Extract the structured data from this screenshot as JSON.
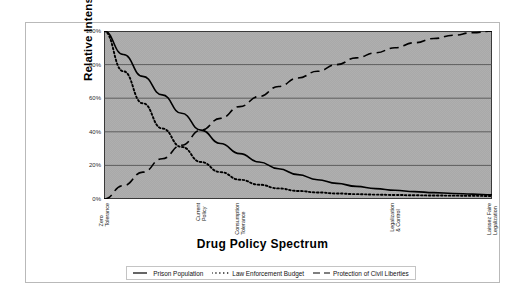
{
  "chart_data": {
    "type": "line",
    "title": "",
    "xlabel": "Drug Policy Spectrum",
    "ylabel": "Relative Intensity",
    "ylim": [
      0,
      100
    ],
    "ytick_labels": [
      "0%",
      "20%",
      "40%",
      "60%",
      "80%",
      "100%"
    ],
    "ytick_values": [
      0,
      20,
      40,
      60,
      80,
      100
    ],
    "grid": "horizontal",
    "legend_position": "bottom",
    "x_axis_ticks": 20,
    "categories": [
      {
        "label_line1": "Zero",
        "label_line2": "Tolerance",
        "x": 0.0
      },
      {
        "label_line1": "Current",
        "label_line2": "Policy",
        "x": 0.25
      },
      {
        "label_line1": "Consumption",
        "label_line2": "Tolerance",
        "x": 0.35
      },
      {
        "label_line1": "Legalization",
        "label_line2": "& Control",
        "x": 0.75
      },
      {
        "label_line1": "Laissez Faire",
        "label_line2": "Legalization",
        "x": 1.0
      }
    ],
    "series": [
      {
        "name": "Prison Population",
        "style": "solid",
        "color": "#000000",
        "x": [
          0,
          0.05,
          0.1,
          0.15,
          0.2,
          0.25,
          0.3,
          0.35,
          0.4,
          0.45,
          0.5,
          0.55,
          0.6,
          0.65,
          0.7,
          0.75,
          0.8,
          0.85,
          0.9,
          0.95,
          1.0
        ],
        "values": [
          100,
          86,
          73,
          62,
          51,
          41,
          33,
          27,
          22,
          18,
          14.5,
          11.5,
          9.3,
          7.5,
          6.2,
          5.2,
          4.4,
          3.8,
          3.3,
          2.9,
          2.5
        ]
      },
      {
        "name": "Law Enforcement Budget",
        "style": "dotted",
        "color": "#000000",
        "x": [
          0,
          0.05,
          0.1,
          0.15,
          0.2,
          0.25,
          0.3,
          0.35,
          0.4,
          0.45,
          0.5,
          0.55,
          0.6,
          0.65,
          0.7,
          0.75,
          0.8,
          0.85,
          0.9,
          0.95,
          1.0
        ],
        "values": [
          100,
          76,
          57,
          42,
          31,
          22,
          16,
          11.5,
          8.5,
          6.3,
          4.8,
          3.9,
          3.3,
          2.9,
          2.6,
          2.4,
          2.2,
          2.1,
          2.0,
          1.9,
          1.8
        ]
      },
      {
        "name": "Protection of Civil Liberties",
        "style": "dashed",
        "color": "#000000",
        "x": [
          0,
          0.05,
          0.1,
          0.15,
          0.2,
          0.25,
          0.3,
          0.35,
          0.4,
          0.45,
          0.5,
          0.55,
          0.6,
          0.65,
          0.7,
          0.75,
          0.8,
          0.85,
          0.9,
          0.95,
          1.0
        ],
        "values": [
          0,
          8,
          16,
          24,
          32,
          41,
          48,
          55,
          61,
          67,
          72,
          76,
          80,
          84,
          87,
          90,
          93,
          95.5,
          97.5,
          99,
          100
        ]
      }
    ]
  },
  "legend": {
    "items": [
      {
        "label": "Prison Population",
        "style": "solid"
      },
      {
        "label": "Law Enforcement Budget",
        "style": "dotted"
      },
      {
        "label": "Protection of Civil Liberties",
        "style": "dashed"
      }
    ]
  }
}
